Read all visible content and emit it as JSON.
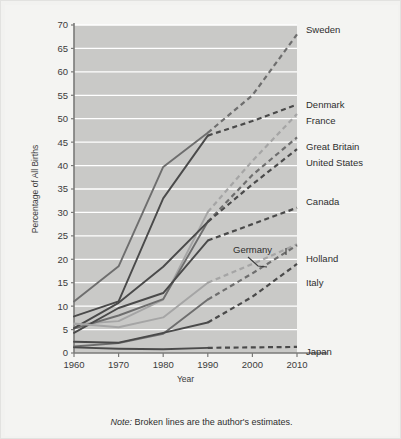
{
  "note": {
    "prefix": "Note:",
    "body": "Broken lines are the author's estimates."
  },
  "axes": {
    "ylabel": "Percentage of All Births",
    "xlabel": "Year",
    "yticks": [
      "0",
      "5",
      "10",
      "15",
      "20",
      "25",
      "30",
      "35",
      "40",
      "45",
      "50",
      "55",
      "60",
      "65",
      "70"
    ],
    "xticks": [
      "1960",
      "1970",
      "1980",
      "1990",
      "2000",
      "2010"
    ]
  },
  "series_labels": {
    "sweden": "Sweden",
    "denmark": "Denmark",
    "france": "France",
    "great_britain": "Great Britain",
    "united_states": "United States",
    "canada": "Canada",
    "germany": "Germany",
    "holland": "Holland",
    "italy": "Italy",
    "japan": "Japan"
  },
  "colors": {
    "plot_background": "#c9c9c7",
    "gridline": "#ffffff",
    "axis": "#7a7a78",
    "line_dark": "#4a4a4a",
    "line_mid": "#6e6e6e",
    "line_light": "#a5a5a5",
    "page_background": "#f2f2f0",
    "text": "#2e2e2e"
  },
  "chart_data": {
    "type": "line",
    "title": "",
    "xlabel": "Year",
    "ylabel": "Percentage of All Births",
    "xlim": [
      1960,
      2010
    ],
    "ylim": [
      0,
      70
    ],
    "xticks": [
      1960,
      1970,
      1980,
      1990,
      2000,
      2010
    ],
    "yticks": [
      0,
      5,
      10,
      15,
      20,
      25,
      30,
      35,
      40,
      45,
      50,
      55,
      60,
      65,
      70
    ],
    "grid": "horizontal",
    "legend": "right-edge-labels",
    "solid_through_year": 1990,
    "x": [
      1960,
      1970,
      1980,
      1990,
      2000,
      2010
    ],
    "series": [
      {
        "name": "Sweden",
        "values": [
          11.0,
          18.5,
          39.7,
          47.0,
          55.0,
          68.0
        ],
        "tone": "line_mid"
      },
      {
        "name": "Denmark",
        "values": [
          7.8,
          11.0,
          33.0,
          46.4,
          49.5,
          53.0
        ],
        "tone": "line_dark"
      },
      {
        "name": "France",
        "values": [
          6.1,
          6.8,
          11.4,
          30.1,
          41.0,
          51.0
        ],
        "tone": "line_light"
      },
      {
        "name": "Great Britain",
        "values": [
          5.2,
          8.0,
          11.5,
          28.0,
          38.0,
          46.0
        ],
        "tone": "line_mid"
      },
      {
        "name": "United States",
        "values": [
          5.3,
          10.7,
          18.4,
          28.0,
          36.0,
          43.5
        ],
        "tone": "line_dark"
      },
      {
        "name": "Canada",
        "values": [
          4.3,
          9.6,
          12.8,
          24.0,
          27.5,
          31.0
        ],
        "tone": "line_dark"
      },
      {
        "name": "Germany",
        "values": [
          6.3,
          5.5,
          7.6,
          15.0,
          19.0,
          23.2
        ],
        "tone": "line_light"
      },
      {
        "name": "Holland",
        "values": [
          1.4,
          2.1,
          4.1,
          11.4,
          17.0,
          23.0
        ],
        "tone": "line_mid"
      },
      {
        "name": "Italy",
        "values": [
          2.4,
          2.2,
          4.3,
          6.5,
          12.0,
          19.0
        ],
        "tone": "line_dark"
      },
      {
        "name": "Japan",
        "values": [
          1.2,
          0.9,
          0.8,
          1.1,
          1.2,
          1.3
        ],
        "tone": "line_dark"
      }
    ],
    "annotations": [
      {
        "text": "Germany",
        "note": "inline callout with leader line near 2000"
      },
      {
        "text": "Holland",
        "note": "inline label near plot right edge"
      }
    ]
  }
}
